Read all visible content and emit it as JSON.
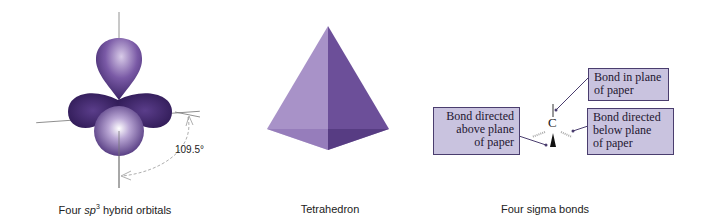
{
  "panels": [
    {
      "caption_prefix": "Four ",
      "caption_italic": "sp",
      "caption_sup": "3",
      "caption_suffix": " hybrid orbitals",
      "angle_label": "109.5°"
    },
    {
      "caption": "Tetrahedron"
    },
    {
      "caption": "Four sigma bonds",
      "atom": "C",
      "labels": {
        "in_plane": [
          "Bond in plane",
          "of paper"
        ],
        "below": [
          "Bond directed",
          "below plane",
          "of paper"
        ],
        "above": [
          "Bond directed",
          "above plane",
          "of paper"
        ]
      }
    }
  ],
  "colors": {
    "orbital_dark": "#3b2466",
    "orbital_light": "#e8e0f2",
    "tetra_light": "#a58fc4",
    "tetra_dark": "#6a4e96",
    "label_box": "#c9c3df",
    "label_border": "#4a3d6e"
  }
}
